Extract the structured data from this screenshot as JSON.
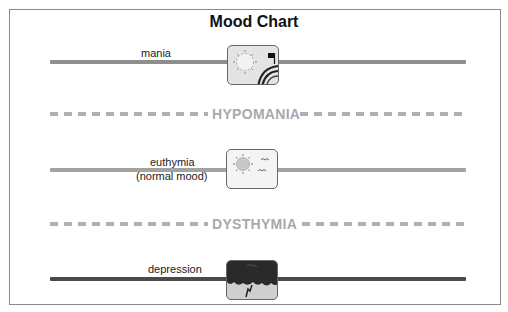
{
  "chart": {
    "title": "Mood Chart",
    "levels": [
      {
        "label": "mania",
        "style": "solid",
        "line_color": "#8e8e8e",
        "icon": "sun-rainbow-music-icon"
      },
      {
        "label": "HYPOMANIA",
        "style": "dashed",
        "line_color": "#b0b0b0"
      },
      {
        "label": "euthymia",
        "sublabel": "(normal mood)",
        "style": "solid",
        "line_color": "#a2a2a2",
        "icon": "sun-birds-icon"
      },
      {
        "label": "DYSTHYMIA",
        "style": "dashed",
        "line_color": "#b0b0b0"
      },
      {
        "label": "depression",
        "style": "solid",
        "line_color": "#4a4a4a",
        "icon": "storm-cloud-lightning-icon"
      }
    ]
  }
}
